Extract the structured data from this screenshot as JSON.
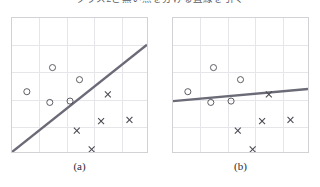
{
  "figure": {
    "top_cutoff_text": "クラス2と黒い点を分ける直線を引く",
    "background_color": "#ffffff"
  },
  "style": {
    "line_color": "#6b6b78",
    "marker_color": "#4a4a52",
    "grid_color": "#e6e6ea",
    "border_color": "#d2d2d6"
  },
  "chart_data": [
    {
      "type": "scatter",
      "id": "a",
      "title": "",
      "caption": "(a)",
      "xlabel": "",
      "ylabel": "",
      "xlim": [
        0,
        5
      ],
      "ylim": [
        0,
        5
      ],
      "grid": true,
      "legend": "none",
      "series": [
        {
          "name": "circle-class",
          "marker": "circle",
          "points": [
            [
              1.5,
              3.15
            ],
            [
              2.5,
              2.7
            ],
            [
              0.55,
              2.25
            ],
            [
              1.4,
              1.85
            ],
            [
              2.15,
              1.9
            ]
          ]
        },
        {
          "name": "cross-class",
          "marker": "cross",
          "points": [
            [
              3.55,
              2.15
            ],
            [
              3.3,
              1.15
            ],
            [
              4.35,
              1.2
            ],
            [
              2.4,
              0.8
            ],
            [
              2.95,
              0.1
            ]
          ]
        }
      ],
      "annotations": [
        {
          "kind": "line",
          "name": "decision-boundary",
          "from": [
            0.0,
            0.0
          ],
          "to": [
            5.0,
            4.0
          ]
        }
      ]
    },
    {
      "type": "scatter",
      "id": "b",
      "title": "",
      "caption": "(b)",
      "xlabel": "",
      "ylabel": "",
      "xlim": [
        0,
        5
      ],
      "ylim": [
        0,
        5
      ],
      "grid": true,
      "legend": "none",
      "series": [
        {
          "name": "circle-class",
          "marker": "circle",
          "points": [
            [
              1.5,
              3.15
            ],
            [
              2.5,
              2.7
            ],
            [
              0.55,
              2.25
            ],
            [
              1.4,
              1.85
            ],
            [
              2.15,
              1.9
            ]
          ]
        },
        {
          "name": "cross-class",
          "marker": "cross",
          "points": [
            [
              3.55,
              2.15
            ],
            [
              3.3,
              1.15
            ],
            [
              4.35,
              1.2
            ],
            [
              2.4,
              0.8
            ],
            [
              2.95,
              0.1
            ]
          ]
        }
      ],
      "annotations": [
        {
          "kind": "line",
          "name": "decision-boundary",
          "from": [
            0.0,
            1.9
          ],
          "to": [
            5.0,
            2.35
          ]
        }
      ]
    }
  ]
}
